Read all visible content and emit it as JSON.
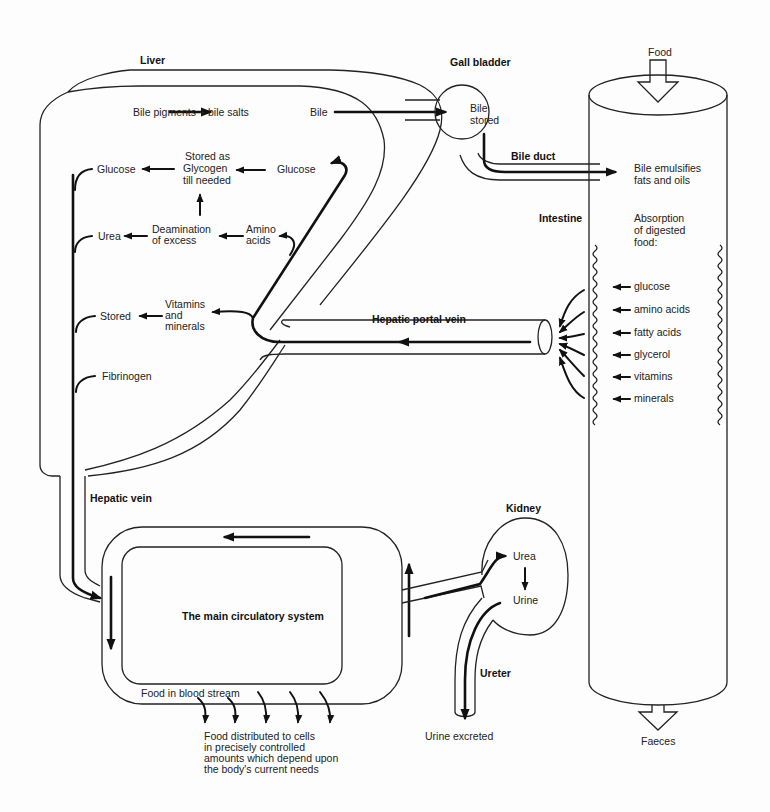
{
  "organs": {
    "liver": "Liver",
    "gall_bladder": "Gall bladder",
    "intestine": "Intestine",
    "hepatic_vein": "Hepatic vein",
    "hepatic_portal_vein": "Hepatic portal vein",
    "bile_duct": "Bile duct",
    "kidney": "Kidney",
    "ureter": "Ureter"
  },
  "liver": {
    "bile_source": "Bile pigments + bile salts",
    "bile": "Bile",
    "glycogen": [
      "Stored as",
      "Glycogen",
      "till needed"
    ],
    "glucose_in": "Glucose",
    "glucose_out": "Glucose",
    "deamination": [
      "Deamination",
      "of excess"
    ],
    "amino": [
      "Amino",
      "acids"
    ],
    "urea": "Urea",
    "vitamins": [
      "Vitamins",
      "and",
      "minerals"
    ],
    "stored": "Stored",
    "fibrinogen": "Fibrinogen"
  },
  "gall_bladder": {
    "text": [
      "Bile",
      "stored"
    ]
  },
  "intestine": {
    "food_in": "Food",
    "bile_effect": [
      "Bile emulsifies",
      "fats and oils"
    ],
    "absorption": [
      "Absorption",
      "of digested",
      "food:"
    ],
    "nutrients": [
      "glucose",
      "amino acids",
      "fatty acids",
      "glycerol",
      "vitamins",
      "minerals"
    ],
    "food_out": "Faeces"
  },
  "circulation": {
    "title": "The main circulatory system",
    "food_in_blood": "Food in blood stream",
    "distribution": [
      "Food distributed to cells",
      "in precisely controlled",
      "amounts which depend upon",
      "the body's current needs"
    ]
  },
  "kidney": {
    "urea": "Urea",
    "urine": "Urine",
    "excreted": "Urine excreted"
  }
}
